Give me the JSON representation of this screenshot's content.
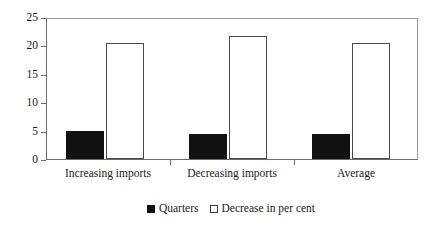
{
  "chart_data": {
    "type": "bar",
    "title": "",
    "subtitle": "",
    "xlabel": "",
    "ylabel": "",
    "categories": [
      "Increasing imports",
      "Decreasing imports",
      "Average"
    ],
    "series": [
      {
        "name": "Quarters",
        "values": [
          5.0,
          4.4,
          4.4
        ],
        "style": "filled-black"
      },
      {
        "name": "Decrease in per cent",
        "values": [
          20.7,
          21.9,
          20.7
        ],
        "style": "hollow-white"
      }
    ],
    "ylim": [
      0,
      25
    ],
    "ytick_values": [
      0,
      5,
      10,
      15,
      20,
      25
    ],
    "ytick_labels": [
      "0",
      "5",
      "10",
      "15",
      "20",
      "25"
    ],
    "grid": false,
    "frame": true,
    "legend_position": "bottom-center",
    "legend_entries": [
      "Quarters",
      "Decrease in per cent"
    ]
  },
  "axis": {
    "y_labels": [
      "25",
      "20",
      "15",
      "10",
      "5",
      "0"
    ]
  },
  "legend": {
    "items": [
      {
        "label": "Quarters",
        "swatch": "filled-square-icon"
      },
      {
        "label": "Decrease in per cent",
        "swatch": "hollow-square-icon"
      }
    ]
  }
}
